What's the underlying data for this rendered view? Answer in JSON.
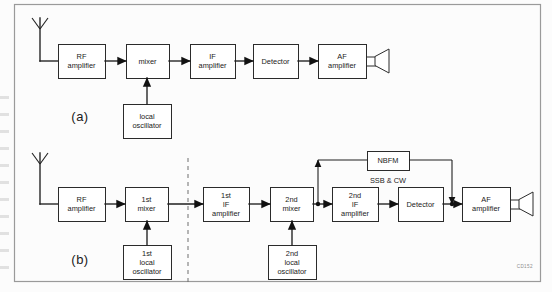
{
  "figure": {
    "title_code": "CD152",
    "frame": {
      "x": 14,
      "y": 4,
      "w": 526,
      "h": 277,
      "border_color": "#9a9a9a"
    },
    "background": "#fcfcfc",
    "line_color": "#1f1f1f",
    "box_fill": "#ffffff",
    "box_stroke": "#2b2b2b"
  },
  "panels": [
    {
      "id": "a",
      "label": "(a)",
      "label_pos": {
        "x": 80,
        "y": 121
      },
      "description": "single conversion superheterodyne receiver",
      "antenna": {
        "x": 40,
        "y_top": 18,
        "y_bottom": 61,
        "spread": 8,
        "v_height": 11
      },
      "feed": {
        "from_x": 40,
        "to_x": 58,
        "y": 61
      },
      "blocks": [
        {
          "name": "rf-amplifier",
          "lines": [
            "RF",
            "amplifier"
          ],
          "x": 58,
          "y": 44,
          "w": 47,
          "h": 34
        },
        {
          "name": "mixer",
          "lines": [
            "mixer"
          ],
          "x": 126,
          "y": 44,
          "w": 43,
          "h": 34
        },
        {
          "name": "if-amplifier",
          "lines": [
            "IF",
            "amplifier"
          ],
          "x": 190,
          "y": 44,
          "w": 45,
          "h": 34
        },
        {
          "name": "detector",
          "lines": [
            "Detector"
          ],
          "x": 253,
          "y": 44,
          "w": 45,
          "h": 34
        },
        {
          "name": "af-amplifier",
          "lines": [
            "AF",
            "amplifier"
          ],
          "x": 318,
          "y": 44,
          "w": 48,
          "h": 34
        },
        {
          "name": "local-oscillator",
          "lines": [
            "local",
            "oscillator"
          ],
          "x": 123,
          "y": 104,
          "w": 48,
          "h": 34
        }
      ],
      "arrows": [
        {
          "from": "rf-amplifier",
          "to": "mixer",
          "x1": 105,
          "x2": 126,
          "y": 61
        },
        {
          "from": "mixer",
          "to": "if-amplifier",
          "x1": 169,
          "x2": 190,
          "y": 61
        },
        {
          "from": "if-amplifier",
          "to": "detector",
          "x1": 235,
          "x2": 253,
          "y": 61
        },
        {
          "from": "detector",
          "to": "af-amplifier",
          "x1": 298,
          "x2": 318,
          "y": 61
        },
        {
          "from": "local-oscillator",
          "to": "mixer",
          "vertical": true,
          "x": 147,
          "y1": 104,
          "y2": 78
        }
      ],
      "speaker": {
        "x": 366,
        "y": 61,
        "box_w": 9,
        "cone_w": 14,
        "cone_h": 24
      }
    },
    {
      "id": "b",
      "label": "(b)",
      "label_pos": {
        "x": 80,
        "y": 264
      },
      "description": "double conversion superheterodyne receiver with NBFM / SSB & CW demodulator path",
      "antenna": {
        "x": 40,
        "y_top": 153,
        "y_bottom": 204,
        "spread": 8,
        "v_height": 11
      },
      "feed": {
        "from_x": 40,
        "to_x": 58,
        "y": 204
      },
      "divider": {
        "name": "stage-divider",
        "x": 188,
        "y1": 158,
        "y2": 285
      },
      "blocks": [
        {
          "name": "rf-amplifier",
          "lines": [
            "RF",
            "amplifier"
          ],
          "x": 58,
          "y": 187,
          "w": 47,
          "h": 34
        },
        {
          "name": "first-mixer",
          "lines": [
            "1st",
            "mixer"
          ],
          "x": 125,
          "y": 187,
          "w": 43,
          "h": 34
        },
        {
          "name": "first-if-amplifier",
          "lines": [
            "1st",
            "IF",
            "amplifier"
          ],
          "x": 203,
          "y": 187,
          "w": 46,
          "h": 34
        },
        {
          "name": "second-mixer",
          "lines": [
            "2nd",
            "mixer"
          ],
          "x": 270,
          "y": 187,
          "w": 43,
          "h": 34
        },
        {
          "name": "second-if-amplifier",
          "lines": [
            "2nd",
            "IF",
            "amplifier"
          ],
          "x": 332,
          "y": 187,
          "w": 46,
          "h": 34
        },
        {
          "name": "detector",
          "lines": [
            "Detector"
          ],
          "x": 398,
          "y": 187,
          "w": 45,
          "h": 34
        },
        {
          "name": "af-amplifier",
          "lines": [
            "AF",
            "amplifier"
          ],
          "x": 462,
          "y": 187,
          "w": 48,
          "h": 34
        },
        {
          "name": "first-local-oscillator",
          "lines": [
            "1st",
            "local",
            "oscillator"
          ],
          "x": 123,
          "y": 245,
          "w": 48,
          "h": 34
        },
        {
          "name": "second-local-oscillator",
          "lines": [
            "2nd",
            "local",
            "oscillator"
          ],
          "x": 268,
          "y": 245,
          "w": 48,
          "h": 34
        },
        {
          "name": "nbfm",
          "lines": [
            "NBFM"
          ],
          "x": 367,
          "y": 151,
          "w": 42,
          "h": 19
        }
      ],
      "mode_label": {
        "name": "ssb-cw-label",
        "text": "SSB & CW",
        "x": 388,
        "y": 183
      },
      "arrows": [
        {
          "from": "rf-amplifier",
          "to": "first-mixer",
          "x1": 105,
          "x2": 125,
          "y": 204
        },
        {
          "from": "first-mixer",
          "to": "first-if-amplifier",
          "x1": 168,
          "x2": 203,
          "y": 204
        },
        {
          "from": "first-if-amplifier",
          "to": "second-mixer",
          "x1": 249,
          "x2": 270,
          "y": 204
        },
        {
          "from": "second-mixer",
          "to": "second-if-amplifier",
          "x1": 313,
          "x2": 332,
          "y": 204
        },
        {
          "from": "second-if-amplifier",
          "to": "detector",
          "x1": 378,
          "x2": 398,
          "y": 204
        },
        {
          "from": "detector",
          "to": "af-amplifier",
          "x1": 443,
          "x2": 462,
          "y": 204
        },
        {
          "from": "first-local-oscillator",
          "to": "first-mixer",
          "vertical": true,
          "x": 147,
          "y1": 245,
          "y2": 221
        },
        {
          "from": "second-local-oscillator",
          "to": "second-mixer",
          "vertical": true,
          "x": 292,
          "y1": 245,
          "y2": 221
        }
      ],
      "bypass": {
        "name": "nbfm-bypass-path",
        "tap_x": 318,
        "tap_y": 204,
        "up_to_y": 160,
        "left_run_to_x": 367,
        "right_run_from_x": 409,
        "down_x": 452,
        "down_to_y": 204,
        "note": "taps signal after 2nd mixer, through NBFM block, rejoins before AF amplifier"
      },
      "speaker": {
        "x": 510,
        "y": 204,
        "box_w": 9,
        "cone_w": 14,
        "cone_h": 24
      }
    }
  ]
}
